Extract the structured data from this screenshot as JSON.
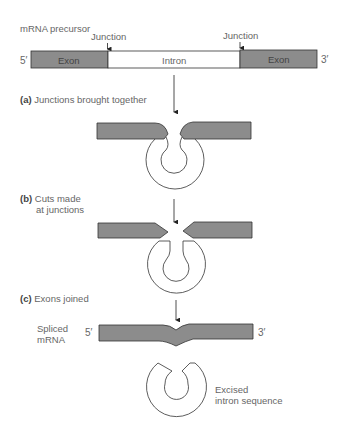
{
  "precursor": {
    "title": "mRNA precursor",
    "five_prime": "5′",
    "three_prime": "3′",
    "junction_left": "Junction",
    "junction_right": "Junction",
    "segments": [
      {
        "label": "Exon",
        "type": "exon"
      },
      {
        "label": "Intron",
        "type": "intron"
      },
      {
        "label": "Exon",
        "type": "exon"
      }
    ]
  },
  "steps": [
    {
      "letter": "(a)",
      "text": "Junctions brought together"
    },
    {
      "letter": "(b)",
      "text_line1": "Cuts made",
      "text_line2": "at junctions"
    },
    {
      "letter": "(c)",
      "text": "Exons joined"
    }
  ],
  "result": {
    "spliced_label_line1": "Spliced",
    "spliced_label_line2": "mRNA",
    "five_prime": "5′",
    "three_prime": "3′",
    "excised_line1": "Excised",
    "excised_line2": "intron sequence"
  },
  "colors": {
    "exon": "#8c8c8c",
    "intron": "#ffffff",
    "stroke": "#333333"
  }
}
